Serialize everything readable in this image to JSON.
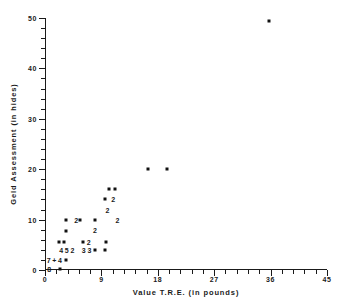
{
  "chart_data": {
    "type": "scatter",
    "title": "",
    "xlabel": "Value T.R.E. (in pounds)",
    "ylabel": "Geld Assessment (in hides)",
    "xlim": [
      0,
      45
    ],
    "ylim": [
      0,
      50
    ],
    "grid": false,
    "legend": "none",
    "marker_color": "#111111",
    "xticks": [
      0,
      9,
      18,
      27,
      36,
      45
    ],
    "xtick_labels": [
      "0",
      "9",
      "18",
      "27",
      "36",
      "45"
    ],
    "x_minor_ticks": [
      1.8,
      3.6,
      5.4,
      7.2,
      10.8,
      12.6,
      14.4,
      16.2,
      19.8,
      21.6,
      23.4,
      25.2,
      28.8,
      30.6,
      32.4,
      34.2,
      37.8,
      39.6,
      41.4,
      43.2
    ],
    "yticks": [
      0,
      10,
      20,
      30,
      40,
      50
    ],
    "ytick_labels": [
      "0",
      "10",
      "20",
      "30",
      "40",
      "50"
    ],
    "y_minor_ticks": [
      2,
      4,
      6,
      8,
      12,
      14,
      16,
      18,
      22,
      24,
      26,
      28,
      32,
      34,
      36,
      38,
      42,
      44,
      46,
      48
    ],
    "points": [
      {
        "x": 35.8,
        "y": 49.5
      },
      {
        "x": 19.5,
        "y": 20.0
      },
      {
        "x": 16.5,
        "y": 20.0
      },
      {
        "x": 11.2,
        "y": 16.0
      },
      {
        "x": 10.2,
        "y": 16.0
      },
      {
        "x": 9.6,
        "y": 14.0
      },
      {
        "x": 8.0,
        "y": 10.0
      },
      {
        "x": 5.6,
        "y": 10.0
      },
      {
        "x": 3.3,
        "y": 10.0
      },
      {
        "x": 3.4,
        "y": 7.7
      },
      {
        "x": 6.0,
        "y": 5.6
      },
      {
        "x": 9.7,
        "y": 5.6
      },
      {
        "x": 3.0,
        "y": 5.6
      },
      {
        "x": 2.2,
        "y": 5.6
      },
      {
        "x": 7.9,
        "y": 4.0
      },
      {
        "x": 9.6,
        "y": 3.9
      },
      {
        "x": 3.3,
        "y": 2.0
      },
      {
        "x": 2.4,
        "y": 0.2
      }
    ],
    "count_labels": [
      {
        "x": 11.6,
        "y": 10.0,
        "text": "2"
      },
      {
        "x": 5.0,
        "y": 10.0,
        "text": "2"
      },
      {
        "x": 10.0,
        "y": 12.0,
        "text": "2"
      },
      {
        "x": 10.9,
        "y": 14.0,
        "text": "2"
      },
      {
        "x": 7.0,
        "y": 5.6,
        "text": "2"
      },
      {
        "x": 8.0,
        "y": 8.0,
        "text": "2"
      },
      {
        "x": 2.6,
        "y": 4.0,
        "text": "4"
      },
      {
        "x": 3.5,
        "y": 4.0,
        "text": "5"
      },
      {
        "x": 4.4,
        "y": 4.0,
        "text": "2"
      },
      {
        "x": 6.2,
        "y": 4.0,
        "text": "3"
      },
      {
        "x": 7.1,
        "y": 4.0,
        "text": "3"
      },
      {
        "x": 0.6,
        "y": 2.0,
        "text": "7"
      },
      {
        "x": 1.5,
        "y": 2.0,
        "text": "+"
      },
      {
        "x": 2.4,
        "y": 2.0,
        "text": "4"
      },
      {
        "x": 0.7,
        "y": 0.2,
        "text": "8"
      }
    ]
  }
}
